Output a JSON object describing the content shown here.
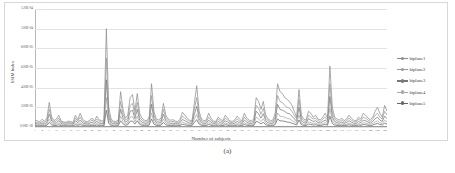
{
  "caption": "(a)",
  "chart_data": {
    "type": "line",
    "title": "",
    "xlabel": "Number of subjects",
    "ylabel": "SSIM Index",
    "grid": true,
    "legend_position": "right",
    "ylim": [
      0,
      0.00012
    ],
    "xlim": [
      1,
      148
    ],
    "ytick_labels": [
      "1.20E-04",
      "1.00E-04",
      "8.00E-05",
      "6.00E-05",
      "4.00E-05",
      "2.00E-05",
      "0.00E+00"
    ],
    "ytick_values": [
      0.00012,
      0.0001,
      8e-05,
      6e-05,
      4e-05,
      2e-05,
      0
    ],
    "xtick_labels": [
      "1",
      "4",
      "7",
      "10",
      "13",
      "16",
      "19",
      "22",
      "25",
      "28",
      "31",
      "34",
      "37",
      "40",
      "43",
      "46",
      "49",
      "52",
      "55",
      "58",
      "61",
      "64",
      "67",
      "70",
      "73",
      "76",
      "79",
      "82",
      "85",
      "88",
      "91",
      "94",
      "97",
      "100",
      "103",
      "106",
      "109",
      "112",
      "115",
      "118",
      "121",
      "124",
      "127",
      "130",
      "133",
      "136",
      "139",
      "142",
      "145",
      "148"
    ],
    "series": [
      {
        "name": "biplane1",
        "color": "#8d8d8d",
        "values": [
          7.0,
          6.2,
          5.5,
          7.8,
          6.0,
          9.0,
          25.0,
          10.0,
          6.5,
          8.0,
          12.0,
          6.0,
          5.2,
          4.8,
          6.0,
          5.5,
          4.6,
          12.0,
          7.5,
          14.0,
          8.0,
          6.0,
          5.4,
          7.0,
          9.0,
          6.2,
          11.0,
          7.0,
          6.5,
          5.8,
          100.0,
          20.0,
          8.0,
          6.0,
          5.6,
          7.0,
          36.0,
          18.0,
          9.0,
          12.0,
          30.0,
          33.0,
          16.0,
          34.0,
          14.0,
          9.0,
          7.0,
          6.2,
          10.0,
          44.0,
          16.0,
          8.0,
          7.2,
          9.0,
          24.0,
          12.0,
          8.0,
          6.8,
          7.5,
          6.0,
          5.4,
          8.0,
          15.0,
          12.0,
          9.0,
          7.0,
          6.2,
          24.0,
          42.0,
          16.0,
          8.0,
          6.5,
          7.0,
          14.0,
          9.0,
          6.0,
          5.6,
          10.0,
          8.0,
          6.4,
          12.0,
          9.0,
          6.0,
          5.8,
          7.2,
          11.0,
          8.0,
          6.0,
          14.0,
          9.0,
          7.0,
          6.2,
          8.0,
          30.0,
          26.0,
          18.0,
          26.0,
          12.0,
          8.0,
          6.5,
          7.0,
          14.0,
          44.0,
          36.0,
          34.0,
          30.0,
          28.0,
          26.0,
          22.0,
          16.0,
          10.0,
          38.0,
          12.0,
          8.0,
          7.0,
          16.0,
          14.0,
          10.0,
          12.0,
          8.0,
          7.2,
          10.0,
          14.0,
          9.0,
          62.0,
          20.0,
          10.0,
          8.0,
          7.0,
          9.0,
          6.5,
          8.0,
          12.0,
          9.0,
          7.0,
          6.2,
          10.0,
          8.0,
          14.0,
          12.0,
          9.0,
          7.5,
          10.0,
          16.0,
          20.0,
          14.0,
          10.0,
          22.0,
          16.0
        ]
      },
      {
        "name": "biplane2",
        "color": "#9a9a9a",
        "values": [
          5.0,
          4.5,
          4.2,
          5.5,
          4.8,
          6.5,
          18.0,
          8.0,
          5.0,
          6.0,
          9.0,
          4.8,
          4.2,
          4.0,
          4.8,
          4.4,
          3.8,
          9.0,
          6.0,
          10.0,
          6.0,
          4.8,
          4.2,
          5.4,
          7.0,
          5.0,
          8.0,
          5.4,
          5.0,
          4.6,
          70.0,
          14.0,
          6.0,
          4.8,
          4.4,
          5.4,
          26.0,
          13.0,
          7.0,
          9.0,
          22.0,
          24.0,
          12.0,
          25.0,
          10.0,
          7.0,
          5.4,
          5.0,
          8.0,
          32.0,
          12.0,
          6.2,
          5.6,
          7.0,
          18.0,
          9.0,
          6.2,
          5.2,
          5.8,
          4.8,
          4.2,
          6.2,
          11.0,
          9.0,
          7.0,
          5.4,
          5.0,
          18.0,
          30.0,
          12.0,
          6.2,
          5.0,
          5.4,
          10.0,
          7.0,
          4.8,
          4.4,
          8.0,
          6.2,
          5.0,
          9.0,
          7.0,
          4.8,
          4.6,
          5.6,
          8.0,
          6.2,
          4.8,
          10.0,
          7.0,
          5.4,
          5.0,
          6.2,
          22.0,
          19.0,
          13.0,
          19.0,
          9.0,
          6.2,
          5.0,
          5.4,
          10.0,
          32.0,
          26.0,
          25.0,
          22.0,
          20.0,
          19.0,
          16.0,
          12.0,
          8.0,
          28.0,
          9.0,
          6.2,
          5.4,
          12.0,
          10.0,
          8.0,
          9.0,
          6.2,
          5.6,
          8.0,
          10.0,
          7.0,
          44.0,
          14.0,
          8.0,
          6.2,
          5.4,
          7.0,
          5.0,
          6.2,
          9.0,
          7.0,
          5.4,
          5.0,
          8.0,
          6.2,
          10.0,
          9.0,
          7.0,
          5.8,
          8.0,
          12.0,
          14.0,
          10.0,
          8.0,
          16.0,
          12.0
        ]
      },
      {
        "name": "biplane3",
        "color": "#787878",
        "values": [
          3.5,
          3.2,
          3.0,
          4.0,
          3.4,
          4.6,
          13.0,
          6.0,
          3.6,
          4.2,
          6.4,
          3.4,
          3.0,
          2.8,
          3.4,
          3.2,
          2.8,
          6.4,
          4.4,
          7.0,
          4.2,
          3.4,
          3.0,
          3.8,
          5.0,
          3.6,
          5.6,
          3.8,
          3.6,
          3.2,
          48.0,
          10.0,
          4.2,
          3.4,
          3.2,
          3.8,
          18.0,
          9.0,
          5.0,
          6.4,
          16.0,
          17.0,
          8.4,
          18.0,
          7.0,
          5.0,
          3.8,
          3.6,
          5.6,
          23.0,
          8.4,
          4.4,
          4.0,
          5.0,
          13.0,
          6.4,
          4.4,
          3.6,
          4.0,
          3.4,
          3.0,
          4.4,
          7.6,
          6.4,
          5.0,
          3.8,
          3.6,
          13.0,
          21.0,
          8.4,
          4.4,
          3.6,
          3.8,
          7.0,
          5.0,
          3.4,
          3.2,
          5.6,
          4.4,
          3.6,
          6.4,
          5.0,
          3.4,
          3.2,
          4.0,
          5.6,
          4.4,
          3.4,
          7.0,
          5.0,
          3.8,
          3.6,
          4.4,
          16.0,
          13.5,
          9.0,
          13.5,
          6.4,
          4.4,
          3.6,
          3.8,
          7.0,
          23.0,
          18.0,
          17.0,
          16.0,
          14.0,
          13.5,
          11.0,
          8.4,
          5.6,
          20.0,
          6.4,
          4.4,
          3.8,
          8.4,
          7.0,
          5.6,
          6.4,
          4.4,
          4.0,
          5.6,
          7.0,
          5.0,
          31.0,
          10.0,
          5.6,
          4.4,
          3.8,
          5.0,
          3.6,
          4.4,
          6.4,
          5.0,
          3.8,
          3.6,
          5.6,
          4.4,
          7.0,
          6.4,
          5.0,
          4.1,
          5.6,
          8.4,
          10.0,
          7.0,
          5.6,
          11.0,
          8.4
        ]
      },
      {
        "name": "biplane4",
        "color": "#a6a6a6",
        "values": [
          2.2,
          2.0,
          1.9,
          2.5,
          2.1,
          2.9,
          8.0,
          3.8,
          2.2,
          2.6,
          4.0,
          2.1,
          1.9,
          1.8,
          2.1,
          2.0,
          1.7,
          4.0,
          2.7,
          4.4,
          2.6,
          2.1,
          1.9,
          2.4,
          3.1,
          2.2,
          3.5,
          2.4,
          2.2,
          2.0,
          30.0,
          6.2,
          2.6,
          2.1,
          2.0,
          2.4,
          11.0,
          5.6,
          3.1,
          4.0,
          10.0,
          10.6,
          5.2,
          11.2,
          4.4,
          3.1,
          2.4,
          2.2,
          3.5,
          14.3,
          5.2,
          2.7,
          2.5,
          3.1,
          8.0,
          4.0,
          2.7,
          2.2,
          2.5,
          2.1,
          1.9,
          2.7,
          4.7,
          4.0,
          3.1,
          2.4,
          2.2,
          8.0,
          13.0,
          5.2,
          2.7,
          2.2,
          2.4,
          4.4,
          3.1,
          2.1,
          2.0,
          3.5,
          2.7,
          2.2,
          4.0,
          3.1,
          2.1,
          2.0,
          2.5,
          3.5,
          2.7,
          2.1,
          4.4,
          3.1,
          2.4,
          2.2,
          2.7,
          10.0,
          8.4,
          5.6,
          8.4,
          4.0,
          2.7,
          2.2,
          2.4,
          4.4,
          14.3,
          11.0,
          10.6,
          10.0,
          8.7,
          8.4,
          6.8,
          5.2,
          3.5,
          12.4,
          4.0,
          2.7,
          2.4,
          5.2,
          4.4,
          3.5,
          4.0,
          2.7,
          2.5,
          3.5,
          4.4,
          3.1,
          19.0,
          6.2,
          3.5,
          2.7,
          2.4,
          3.1,
          2.2,
          2.7,
          4.0,
          3.1,
          2.4,
          2.2,
          3.5,
          2.7,
          4.4,
          4.0,
          3.1,
          2.6,
          3.5,
          5.2,
          6.2,
          4.4,
          3.5,
          6.8,
          5.2
        ]
      },
      {
        "name": "biplane5",
        "color": "#666666",
        "values": [
          1.3,
          1.2,
          1.1,
          1.5,
          1.2,
          1.7,
          4.6,
          2.2,
          1.3,
          1.5,
          2.3,
          1.2,
          1.1,
          1.0,
          1.2,
          1.1,
          1.0,
          2.3,
          1.6,
          2.6,
          1.5,
          1.2,
          1.1,
          1.4,
          1.8,
          1.3,
          2.0,
          1.4,
          1.3,
          1.2,
          17.0,
          3.6,
          1.5,
          1.2,
          1.1,
          1.4,
          6.3,
          3.2,
          1.8,
          2.3,
          5.8,
          6.1,
          3.0,
          6.4,
          2.6,
          1.8,
          1.4,
          1.3,
          2.0,
          8.2,
          3.0,
          1.6,
          1.4,
          1.8,
          4.6,
          2.3,
          1.6,
          1.3,
          1.4,
          1.2,
          1.1,
          1.6,
          2.7,
          2.3,
          1.8,
          1.4,
          1.3,
          4.6,
          7.5,
          3.0,
          1.6,
          1.3,
          1.4,
          2.6,
          1.8,
          1.2,
          1.1,
          2.0,
          1.6,
          1.3,
          2.3,
          1.8,
          1.2,
          1.1,
          1.4,
          2.0,
          1.6,
          1.2,
          2.6,
          1.8,
          1.4,
          1.3,
          1.6,
          5.8,
          4.8,
          3.2,
          4.8,
          2.3,
          1.6,
          1.3,
          1.4,
          2.6,
          8.2,
          6.3,
          6.1,
          5.8,
          5.0,
          4.8,
          3.9,
          3.0,
          2.0,
          7.1,
          2.3,
          1.6,
          1.4,
          3.0,
          2.6,
          2.0,
          2.3,
          1.6,
          1.4,
          2.0,
          2.6,
          1.8,
          11.0,
          3.6,
          2.0,
          1.6,
          1.4,
          1.8,
          1.3,
          1.6,
          2.3,
          1.8,
          1.4,
          1.3,
          2.0,
          1.6,
          2.6,
          2.3,
          1.8,
          1.5,
          2.0,
          3.0,
          3.6,
          2.6,
          2.0,
          3.9,
          3.0
        ]
      }
    ],
    "value_scale_note": "series values are in units of 1e-6"
  }
}
